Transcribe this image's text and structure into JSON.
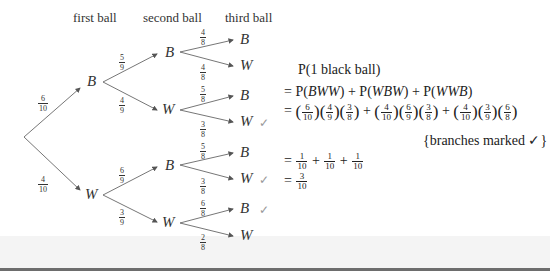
{
  "headers": {
    "first": "first ball",
    "second": "second ball",
    "third": "third ball"
  },
  "tree": {
    "level1": [
      {
        "label": "B",
        "prob_num": "6",
        "prob_den": "10"
      },
      {
        "label": "W",
        "prob_num": "4",
        "prob_den": "10"
      }
    ],
    "level2": [
      {
        "label": "B",
        "prob_num": "5",
        "prob_den": "9"
      },
      {
        "label": "W",
        "prob_num": "4",
        "prob_den": "9"
      },
      {
        "label": "B",
        "prob_num": "6",
        "prob_den": "9"
      },
      {
        "label": "W",
        "prob_num": "3",
        "prob_den": "9"
      }
    ],
    "level3": [
      {
        "label": "B",
        "prob_num": "4",
        "prob_den": "8",
        "marked": false
      },
      {
        "label": "W",
        "prob_num": "4",
        "prob_den": "8",
        "marked": false
      },
      {
        "label": "B",
        "prob_num": "5",
        "prob_den": "8",
        "marked": false
      },
      {
        "label": "W",
        "prob_num": "3",
        "prob_den": "8",
        "marked": true
      },
      {
        "label": "B",
        "prob_num": "5",
        "prob_den": "8",
        "marked": false
      },
      {
        "label": "W",
        "prob_num": "3",
        "prob_den": "8",
        "marked": true
      },
      {
        "label": "B",
        "prob_num": "6",
        "prob_den": "8",
        "marked": true
      },
      {
        "label": "W",
        "prob_num": "2",
        "prob_den": "8",
        "marked": false
      }
    ],
    "check_mark": "✓"
  },
  "calculation": {
    "line1": "P(1 black ball)",
    "line2_prefix": "= P(",
    "terms": [
      "BWW",
      "WBW",
      "WWB"
    ],
    "line3": {
      "products": [
        [
          {
            "n": "6",
            "d": "10"
          },
          {
            "n": "4",
            "d": "9"
          },
          {
            "n": "3",
            "d": "8"
          }
        ],
        [
          {
            "n": "4",
            "d": "10"
          },
          {
            "n": "6",
            "d": "9"
          },
          {
            "n": "3",
            "d": "8"
          }
        ],
        [
          {
            "n": "4",
            "d": "10"
          },
          {
            "n": "3",
            "d": "9"
          },
          {
            "n": "6",
            "d": "8"
          }
        ]
      ]
    },
    "note": "{branches marked ✓}",
    "line4": [
      {
        "n": "1",
        "d": "10"
      },
      {
        "n": "1",
        "d": "10"
      },
      {
        "n": "1",
        "d": "10"
      }
    ],
    "result": {
      "n": "3",
      "d": "10"
    },
    "eq": "=",
    "plus": "+",
    "P": "P",
    "lpar": "(",
    "rpar": ")"
  }
}
